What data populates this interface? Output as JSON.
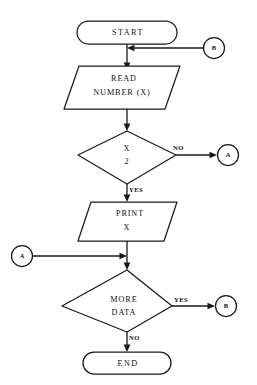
{
  "diagram": {
    "type": "flowchart",
    "background_color": "#ffffff",
    "line_color": "#1a1a1a",
    "text_color": "#111111"
  },
  "nodes": {
    "start": {
      "label": "START",
      "shape": "terminator"
    },
    "read": {
      "label_line1": "READ",
      "label_line2": "NUMBER (X)",
      "shape": "parallelogram"
    },
    "decision_divisible": {
      "label_line1": "X",
      "label_line2": "2",
      "shape": "diamond"
    },
    "print": {
      "label_line1": "PRINT",
      "label_line2": "X",
      "shape": "parallelogram"
    },
    "decision_more": {
      "label_line1": "MORE",
      "label_line2": "DATA",
      "shape": "diamond"
    },
    "end": {
      "label": "END",
      "shape": "terminator"
    }
  },
  "connectors": {
    "b_top_right": {
      "label": "B",
      "shape": "circle"
    },
    "a_right": {
      "label": "A",
      "shape": "circle"
    },
    "a_left": {
      "label": "A",
      "shape": "circle"
    },
    "b_bottom_right": {
      "label": "B",
      "shape": "circle"
    }
  },
  "edge_labels": {
    "divisible_no": "NO",
    "divisible_yes": "YES",
    "more_yes": "YES",
    "more_no": "NO"
  }
}
